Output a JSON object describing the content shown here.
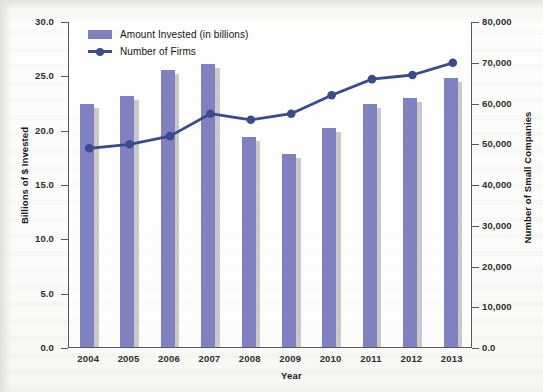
{
  "chart_data": {
    "type": "bar",
    "title": "",
    "xlabel": "Year",
    "ylabel": "Billions of $ Invested",
    "y2label": "Number of Small Companies",
    "categories": [
      "2004",
      "2005",
      "2006",
      "2007",
      "2008",
      "2009",
      "2010",
      "2011",
      "2012",
      "2013"
    ],
    "ylim": [
      0,
      30
    ],
    "y2lim": [
      0,
      80000
    ],
    "ytick_labels": [
      "0.0",
      "5.0",
      "10.0",
      "15.0",
      "20.0",
      "25.0",
      "30.0"
    ],
    "ytick_values": [
      0,
      5,
      10,
      15,
      20,
      25,
      30
    ],
    "y2tick_labels": [
      "0.0",
      "10,000",
      "20,000",
      "30,000",
      "40,000",
      "50,000",
      "60,000",
      "70,000",
      "80,000"
    ],
    "y2tick_values": [
      0,
      10000,
      20000,
      30000,
      40000,
      50000,
      60000,
      70000,
      80000
    ],
    "grid": false,
    "legend_position": "top-left",
    "series": [
      {
        "name": "Amount Invested (in billions)",
        "type": "bar",
        "axis": "left",
        "color": "#8081c0",
        "values": [
          22.4,
          23.1,
          25.5,
          26.0,
          19.3,
          17.8,
          20.2,
          22.4,
          22.9,
          24.8
        ]
      },
      {
        "name": "Number of Firms",
        "type": "line",
        "axis": "right",
        "color": "#3c4a8e",
        "values": [
          49000,
          50000,
          52000,
          57500,
          56000,
          57500,
          62000,
          66000,
          67000,
          70000
        ]
      }
    ]
  },
  "legend": {
    "items": [
      {
        "label": "Amount Invested (in billions)",
        "marker": "swatch"
      },
      {
        "label": "Number of Firms",
        "marker": "line-point"
      }
    ]
  },
  "colors": {
    "bar": "#8081c0",
    "bar_shadow": "#c9c9c9",
    "line": "#3c4a8e",
    "axis": "#58585a",
    "paper": "#fbfbf8"
  }
}
